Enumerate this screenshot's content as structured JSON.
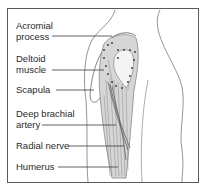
{
  "diagram": {
    "labels": [
      {
        "id": "acromial-process",
        "lines": [
          "Acromial",
          "process"
        ]
      },
      {
        "id": "deltoid-muscle",
        "lines": [
          "Deltoid",
          "muscle"
        ]
      },
      {
        "id": "scapula",
        "lines": [
          "Scapula"
        ]
      },
      {
        "id": "deep-brachial-artery",
        "lines": [
          "Deep brachial",
          "artery"
        ]
      },
      {
        "id": "radial-nerve",
        "lines": [
          "Radial nerve"
        ]
      },
      {
        "id": "humerus",
        "lines": [
          "Humerus"
        ]
      }
    ],
    "colors": {
      "frame": "#5a5a5a",
      "text": "#2a2a2a",
      "leader": "#3a3a3a",
      "muscle": "#9a9a9a",
      "outline": "#777777",
      "injection_dots": "#333333"
    }
  }
}
